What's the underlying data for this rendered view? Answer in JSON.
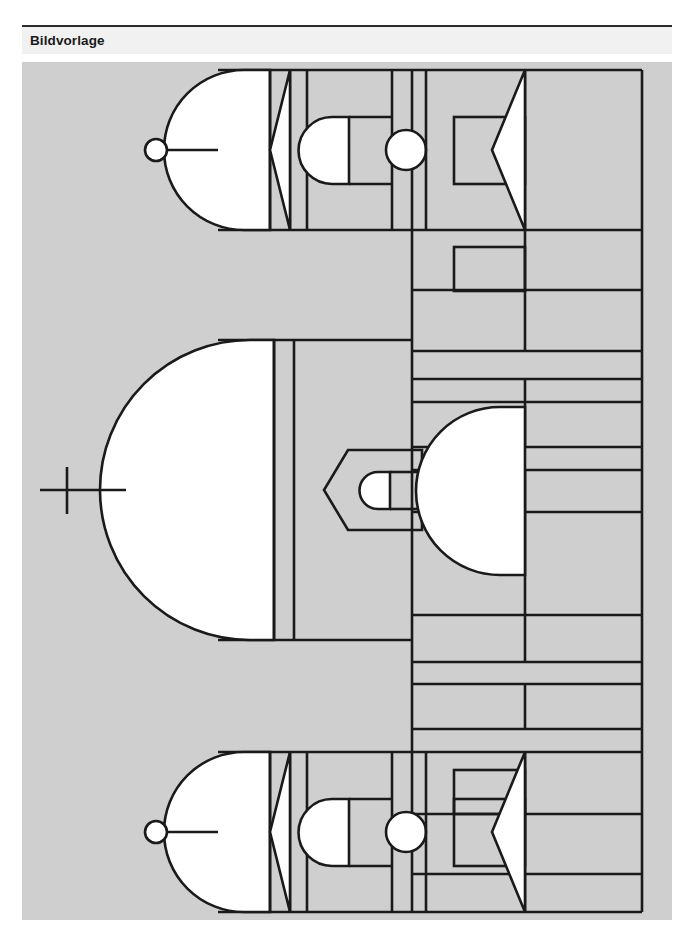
{
  "header": {
    "title": "Bildvorlage"
  },
  "canvas": {
    "background_color": "#cfcfcf",
    "stroke_color": "#1a1a1a",
    "fill_white": "#ffffff",
    "label": "geometric-line-drawing"
  },
  "figure": {
    "groups": [
      {
        "name": "top-figure",
        "elements": [
          "small-circle-connector",
          "connector-line",
          "large-dome-white",
          "narrow-vertical-strip",
          "triangle-notch-white",
          "small-dome-white",
          "small-circle-white",
          "arrow-chevron-white",
          "inner-rectangle"
        ]
      },
      {
        "name": "middle-figure",
        "elements": [
          "cross-connector",
          "connector-line",
          "large-dome-white",
          "double-vertical-strip",
          "notched-rectangle",
          "small-rounded-tab-white",
          "right-dome-white"
        ]
      },
      {
        "name": "bottom-figure",
        "elements": [
          "small-circle-connector",
          "connector-line",
          "large-dome-white",
          "narrow-vertical-strip",
          "triangle-notch-white",
          "small-dome-white",
          "small-circle-white",
          "arrow-chevron-white",
          "inner-rectangle"
        ]
      }
    ],
    "right_band": {
      "name": "right-vertical-grid",
      "description": "Tall rectangular band on the right subdivided by horizontal rules and one vertical rule into stacked cells."
    }
  }
}
